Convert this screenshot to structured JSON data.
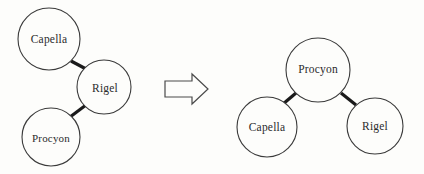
{
  "figure": {
    "background_color": "#fdfdfb",
    "ink_color": "#2b2b2b",
    "circle_stroke_color": "#3a3a3a",
    "edge_color": "#1a1a1a"
  },
  "left_graph": {
    "name": "before-graph",
    "nodes": [
      {
        "id": "capella",
        "label": "Capella",
        "cx": 49,
        "cy": 39,
        "r": 31
      },
      {
        "id": "rigel",
        "label": "Rigel",
        "cx": 104,
        "cy": 87,
        "r": 27
      },
      {
        "id": "procyon",
        "label": "Procyon",
        "cx": 51,
        "cy": 137,
        "r": 29
      }
    ],
    "edges": [
      {
        "from": "capella",
        "to": "rigel"
      },
      {
        "from": "rigel",
        "to": "procyon"
      }
    ]
  },
  "arrow": {
    "name": "transform-arrow",
    "direction": "right",
    "label": "",
    "x": 164,
    "y": 75,
    "width": 44,
    "height": 28
  },
  "right_graph": {
    "name": "after-graph",
    "nodes": [
      {
        "id": "procyon",
        "label": "Procyon",
        "cx": 318,
        "cy": 70,
        "r": 32
      },
      {
        "id": "capella",
        "label": "Capella",
        "cx": 267,
        "cy": 127,
        "r": 30
      },
      {
        "id": "rigel",
        "label": "Rigel",
        "cx": 375,
        "cy": 126,
        "r": 28
      }
    ],
    "edges": [
      {
        "from": "procyon",
        "to": "capella"
      },
      {
        "from": "procyon",
        "to": "rigel"
      }
    ]
  },
  "labels": {
    "left_capella": "Capella",
    "left_rigel": "Rigel",
    "left_procyon": "Procyon",
    "right_procyon": "Procyon",
    "right_capella": "Capella",
    "right_rigel": "Rigel"
  }
}
